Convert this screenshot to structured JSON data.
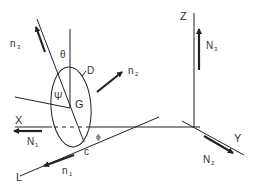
{
  "diagram": {
    "type": "rigid-body-coordinate-diagram",
    "axes": {
      "x_label": "X",
      "y_label": "Y",
      "z_label": "Z",
      "l_label": "L"
    },
    "vectors": {
      "N1": {
        "base": "N",
        "sub": "1"
      },
      "N2": {
        "base": "N",
        "sub": "2"
      },
      "N3": {
        "base": "N",
        "sub": "3"
      },
      "n1": {
        "base": "n",
        "sub": "1"
      },
      "n2": {
        "base": "n",
        "sub": "2"
      },
      "n3": {
        "base": "n",
        "sub": "3"
      }
    },
    "angles": {
      "theta": "θ",
      "psi": "Ψ",
      "phi": "ϕ"
    },
    "points": {
      "G": "G",
      "D": "D",
      "c": "c"
    },
    "colors": {
      "line": "#222222",
      "text": "#333333",
      "background": "#ffffff"
    }
  }
}
